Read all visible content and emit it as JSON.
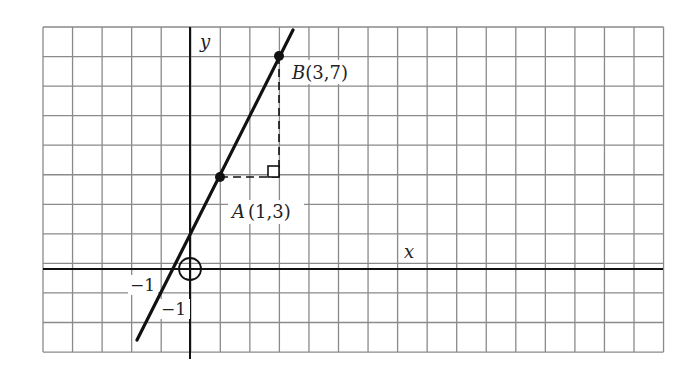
{
  "chart_data": {
    "type": "line",
    "title": "",
    "xlabel": "x",
    "ylabel": "y",
    "grid": true,
    "xlim": [
      -5,
      16
    ],
    "ylim": [
      -3,
      8
    ],
    "tick_labels": {
      "x": [
        "-1"
      ],
      "y": [
        "-1"
      ]
    },
    "points": [
      {
        "name": "A",
        "x": 1,
        "y": 3,
        "label": "A(1,3)"
      },
      {
        "name": "B",
        "x": 3,
        "y": 7,
        "label": "B(3,7)"
      }
    ],
    "series": [
      {
        "name": "line AB",
        "equation": "y = 2x + 1",
        "x": [
          -1.8,
          3.4
        ],
        "y": [
          -2.6,
          7.8
        ]
      }
    ],
    "annotations": [
      "dashed horizontal segment from A to (3,3)",
      "dashed vertical segment from (3,3) to B",
      "right-angle marker at (3,3)",
      "circle marker at origin"
    ]
  },
  "labels": {
    "y_axis": "y",
    "x_axis": "x",
    "point_a_name": "A",
    "point_a_coords": "(1,3)",
    "point_b_name": "B",
    "point_b_coords": "(3,7)",
    "x_tick_neg1": "−1",
    "y_tick_neg1": "−1"
  },
  "colors": {
    "grid": "#8a8a8a",
    "axis": "#111111",
    "line": "#111111",
    "background": "#ffffff"
  }
}
